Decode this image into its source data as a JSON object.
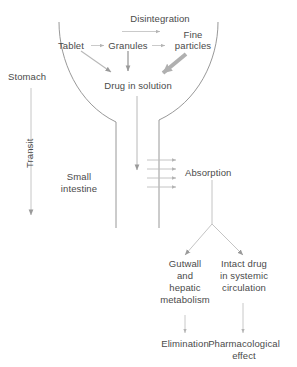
{
  "figure": {
    "type": "flow-diagram",
    "background_color": "#ffffff",
    "line_color": "#8c8c8c",
    "text_color": "#4a4a4a",
    "arrow_color": "#9a9a9a",
    "thick_arrow_color": "#b0b0b0"
  },
  "labels": {
    "disintegration": "Disintegration",
    "tablet": "Tablet",
    "granules": "Granules",
    "fine_particles_line1": "Fine",
    "fine_particles_line2": "particles",
    "drug_in_solution": "Drug in solution",
    "stomach": "Stomach",
    "transit": "Transit",
    "small_intestine_line1": "Small",
    "small_intestine_line2": "intestine",
    "absorption": "Absorption",
    "gutwall_line1": "Gutwall",
    "gutwall_line2": "and",
    "gutwall_line3": "hepatic",
    "gutwall_line4": "metabolism",
    "intact_line1": "Intact drug",
    "intact_line2": "in systemic",
    "intact_line3": "circulation",
    "elimination": "Elimination",
    "pharmacological_line1": "Pharmacological",
    "pharmacological_line2": "effect"
  },
  "flow": {
    "nodes": [
      "Tablet",
      "Granules",
      "Fine particles",
      "Drug in solution",
      "Absorption",
      "Gutwall and hepatic metabolism",
      "Intact drug in systemic circulation",
      "Elimination",
      "Pharmacological effect"
    ],
    "processes": [
      "Disintegration",
      "Transit",
      "Absorption"
    ],
    "anatomy": [
      "Stomach",
      "Small intestine"
    ]
  }
}
